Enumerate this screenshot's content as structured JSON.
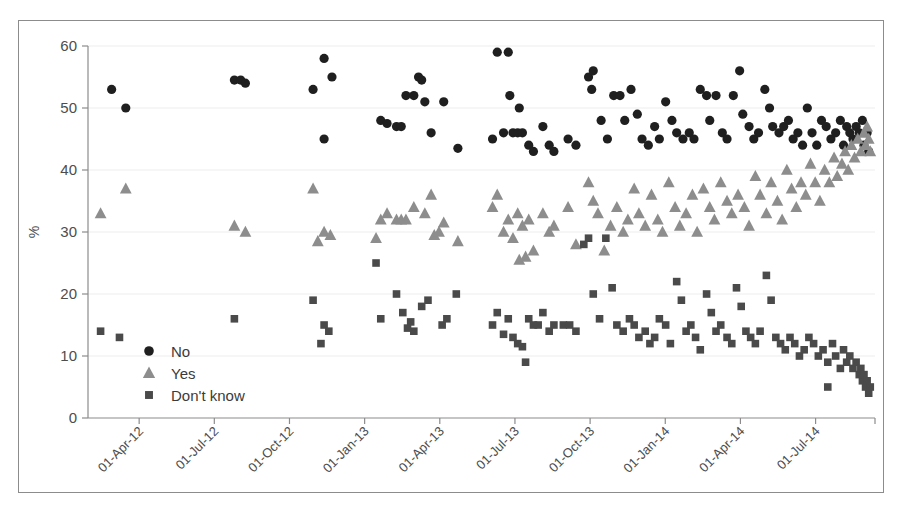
{
  "chart_data": {
    "type": "scatter",
    "title": "",
    "subtitle": "",
    "xlabel": "",
    "ylabel": "%",
    "ylim": [
      0,
      60
    ],
    "yticks": [
      0,
      10,
      20,
      30,
      40,
      50,
      60
    ],
    "xlim": [
      "2012-02-15",
      "2014-09-20"
    ],
    "xticks": [
      "01-Apr-12",
      "01-Jul-12",
      "01-Oct-12",
      "01-Jan-13",
      "01-Apr-13",
      "01-Jul-13",
      "01-Oct-13",
      "01-Jan-14",
      "01-Apr-14",
      "01-Jul-14"
    ],
    "xtick_rotation": -45,
    "grid": "horizontal",
    "legend_position": "lower-left-inside",
    "marker_colors": {
      "No": "#1f1f1f",
      "Yes": "#8d8d8d",
      "Don't know": "#4a4a4a"
    },
    "marker_shapes": {
      "No": "circle",
      "Yes": "triangle",
      "Don't know": "square"
    },
    "legend": [
      "No",
      "Yes",
      "Don't know"
    ],
    "series": [
      {
        "name": "No",
        "shape": "circle",
        "color": "#1f1f1f",
        "points": [
          [
            0.03,
            53
          ],
          [
            0.048,
            50
          ],
          [
            0.186,
            54.5
          ],
          [
            0.194,
            54.5
          ],
          [
            0.2,
            54
          ],
          [
            0.3,
            58
          ],
          [
            0.286,
            53
          ],
          [
            0.31,
            55
          ],
          [
            0.3,
            45
          ],
          [
            0.372,
            48
          ],
          [
            0.38,
            47.5
          ],
          [
            0.392,
            47
          ],
          [
            0.398,
            47
          ],
          [
            0.404,
            52
          ],
          [
            0.414,
            52
          ],
          [
            0.428,
            51
          ],
          [
            0.436,
            46
          ],
          [
            0.42,
            55
          ],
          [
            0.424,
            54.5
          ],
          [
            0.452,
            51
          ],
          [
            0.47,
            43.5
          ],
          [
            0.52,
            59
          ],
          [
            0.534,
            59
          ],
          [
            0.536,
            52
          ],
          [
            0.548,
            50
          ],
          [
            0.528,
            46
          ],
          [
            0.54,
            46
          ],
          [
            0.546,
            46
          ],
          [
            0.552,
            46
          ],
          [
            0.514,
            45
          ],
          [
            0.56,
            44
          ],
          [
            0.566,
            43
          ],
          [
            0.578,
            47
          ],
          [
            0.586,
            44
          ],
          [
            0.592,
            43
          ],
          [
            0.61,
            45
          ],
          [
            0.62,
            44
          ],
          [
            0.636,
            55
          ],
          [
            0.642,
            56
          ],
          [
            0.64,
            53
          ],
          [
            0.652,
            48
          ],
          [
            0.66,
            45
          ],
          [
            0.668,
            52
          ],
          [
            0.676,
            52
          ],
          [
            0.682,
            48
          ],
          [
            0.69,
            53
          ],
          [
            0.698,
            49
          ],
          [
            0.704,
            45
          ],
          [
            0.712,
            44
          ],
          [
            0.72,
            47
          ],
          [
            0.726,
            45
          ],
          [
            0.734,
            51
          ],
          [
            0.742,
            48
          ],
          [
            0.748,
            46
          ],
          [
            0.756,
            45
          ],
          [
            0.764,
            46
          ],
          [
            0.77,
            45
          ],
          [
            0.778,
            53
          ],
          [
            0.786,
            52
          ],
          [
            0.79,
            48
          ],
          [
            0.798,
            52
          ],
          [
            0.806,
            46
          ],
          [
            0.812,
            45
          ],
          [
            0.82,
            52
          ],
          [
            0.828,
            56
          ],
          [
            0.832,
            49
          ],
          [
            0.84,
            47
          ],
          [
            0.846,
            45
          ],
          [
            0.852,
            46
          ],
          [
            0.86,
            53
          ],
          [
            0.866,
            50
          ],
          [
            0.87,
            47
          ],
          [
            0.878,
            46
          ],
          [
            0.884,
            47
          ],
          [
            0.89,
            48
          ],
          [
            0.896,
            45
          ],
          [
            0.902,
            46
          ],
          [
            0.908,
            44
          ],
          [
            0.914,
            50
          ],
          [
            0.92,
            46
          ],
          [
            0.926,
            44
          ],
          [
            0.932,
            48
          ],
          [
            0.938,
            47
          ],
          [
            0.944,
            45
          ],
          [
            0.95,
            46
          ],
          [
            0.956,
            48
          ],
          [
            0.96,
            44
          ],
          [
            0.964,
            47
          ],
          [
            0.968,
            46
          ],
          [
            0.972,
            45
          ],
          [
            0.976,
            47
          ],
          [
            0.98,
            46
          ],
          [
            0.984,
            48
          ],
          [
            0.986,
            44
          ],
          [
            0.99,
            46
          ],
          [
            0.992,
            43
          ]
        ]
      },
      {
        "name": "Yes",
        "shape": "triangle",
        "color": "#8d8d8d",
        "points": [
          [
            0.016,
            33
          ],
          [
            0.048,
            37
          ],
          [
            0.186,
            31
          ],
          [
            0.2,
            30
          ],
          [
            0.286,
            37
          ],
          [
            0.3,
            30
          ],
          [
            0.308,
            29.5
          ],
          [
            0.292,
            28.5
          ],
          [
            0.372,
            32
          ],
          [
            0.38,
            33
          ],
          [
            0.392,
            32
          ],
          [
            0.398,
            32
          ],
          [
            0.404,
            32
          ],
          [
            0.414,
            34
          ],
          [
            0.428,
            33
          ],
          [
            0.436,
            36
          ],
          [
            0.452,
            31.5
          ],
          [
            0.47,
            28.5
          ],
          [
            0.44,
            29.5
          ],
          [
            0.446,
            30
          ],
          [
            0.366,
            29
          ],
          [
            0.52,
            36
          ],
          [
            0.534,
            32
          ],
          [
            0.546,
            33
          ],
          [
            0.528,
            30
          ],
          [
            0.54,
            29
          ],
          [
            0.552,
            31
          ],
          [
            0.514,
            34
          ],
          [
            0.56,
            32
          ],
          [
            0.566,
            27
          ],
          [
            0.578,
            33
          ],
          [
            0.586,
            30
          ],
          [
            0.592,
            31
          ],
          [
            0.61,
            34
          ],
          [
            0.62,
            28
          ],
          [
            0.548,
            25.5
          ],
          [
            0.556,
            26
          ],
          [
            0.636,
            38
          ],
          [
            0.642,
            35
          ],
          [
            0.648,
            33
          ],
          [
            0.656,
            27
          ],
          [
            0.664,
            31
          ],
          [
            0.672,
            34
          ],
          [
            0.68,
            30
          ],
          [
            0.686,
            32
          ],
          [
            0.694,
            37
          ],
          [
            0.7,
            33
          ],
          [
            0.708,
            31
          ],
          [
            0.716,
            36
          ],
          [
            0.724,
            32
          ],
          [
            0.73,
            30
          ],
          [
            0.738,
            38
          ],
          [
            0.746,
            34
          ],
          [
            0.752,
            31
          ],
          [
            0.76,
            33
          ],
          [
            0.768,
            36
          ],
          [
            0.774,
            30
          ],
          [
            0.782,
            37
          ],
          [
            0.79,
            34
          ],
          [
            0.796,
            32
          ],
          [
            0.804,
            38
          ],
          [
            0.812,
            35
          ],
          [
            0.818,
            33
          ],
          [
            0.826,
            36
          ],
          [
            0.834,
            34
          ],
          [
            0.84,
            31
          ],
          [
            0.848,
            39
          ],
          [
            0.854,
            36
          ],
          [
            0.862,
            33
          ],
          [
            0.868,
            38
          ],
          [
            0.876,
            35
          ],
          [
            0.882,
            32
          ],
          [
            0.888,
            40
          ],
          [
            0.894,
            37
          ],
          [
            0.9,
            34
          ],
          [
            0.906,
            38
          ],
          [
            0.912,
            36
          ],
          [
            0.918,
            41
          ],
          [
            0.924,
            38
          ],
          [
            0.93,
            35
          ],
          [
            0.936,
            40
          ],
          [
            0.942,
            38
          ],
          [
            0.948,
            42
          ],
          [
            0.952,
            39
          ],
          [
            0.958,
            41
          ],
          [
            0.962,
            43
          ],
          [
            0.966,
            40
          ],
          [
            0.97,
            44
          ],
          [
            0.974,
            42
          ],
          [
            0.978,
            45
          ],
          [
            0.982,
            43
          ],
          [
            0.986,
            46
          ],
          [
            0.988,
            44
          ],
          [
            0.99,
            47
          ],
          [
            0.992,
            45
          ],
          [
            0.994,
            43
          ]
        ]
      },
      {
        "name": "Don't know",
        "shape": "square",
        "color": "#4a4a4a",
        "points": [
          [
            0.016,
            14
          ],
          [
            0.04,
            13
          ],
          [
            0.186,
            16
          ],
          [
            0.286,
            19
          ],
          [
            0.3,
            15
          ],
          [
            0.306,
            14
          ],
          [
            0.296,
            12
          ],
          [
            0.366,
            25
          ],
          [
            0.372,
            16
          ],
          [
            0.392,
            20
          ],
          [
            0.4,
            17
          ],
          [
            0.41,
            15.5
          ],
          [
            0.424,
            18
          ],
          [
            0.432,
            19
          ],
          [
            0.45,
            15
          ],
          [
            0.456,
            16
          ],
          [
            0.468,
            20
          ],
          [
            0.414,
            14
          ],
          [
            0.406,
            14.5
          ],
          [
            0.52,
            17
          ],
          [
            0.534,
            16
          ],
          [
            0.54,
            13
          ],
          [
            0.528,
            13.5
          ],
          [
            0.546,
            12
          ],
          [
            0.552,
            11.5
          ],
          [
            0.514,
            15
          ],
          [
            0.56,
            16
          ],
          [
            0.566,
            15
          ],
          [
            0.556,
            9
          ],
          [
            0.572,
            15
          ],
          [
            0.578,
            17
          ],
          [
            0.586,
            14
          ],
          [
            0.592,
            15
          ],
          [
            0.604,
            15
          ],
          [
            0.612,
            15
          ],
          [
            0.62,
            14
          ],
          [
            0.63,
            28
          ],
          [
            0.636,
            29
          ],
          [
            0.642,
            20
          ],
          [
            0.65,
            16
          ],
          [
            0.658,
            29
          ],
          [
            0.666,
            21
          ],
          [
            0.672,
            15
          ],
          [
            0.68,
            14
          ],
          [
            0.688,
            16
          ],
          [
            0.694,
            15
          ],
          [
            0.7,
            13
          ],
          [
            0.708,
            14
          ],
          [
            0.714,
            12
          ],
          [
            0.72,
            13
          ],
          [
            0.726,
            16
          ],
          [
            0.734,
            15
          ],
          [
            0.74,
            12
          ],
          [
            0.748,
            22
          ],
          [
            0.754,
            19
          ],
          [
            0.76,
            14
          ],
          [
            0.766,
            15
          ],
          [
            0.772,
            13
          ],
          [
            0.778,
            11
          ],
          [
            0.786,
            20
          ],
          [
            0.792,
            17
          ],
          [
            0.798,
            14
          ],
          [
            0.804,
            15
          ],
          [
            0.812,
            13
          ],
          [
            0.818,
            12
          ],
          [
            0.824,
            21
          ],
          [
            0.83,
            18
          ],
          [
            0.836,
            14
          ],
          [
            0.842,
            13
          ],
          [
            0.848,
            12
          ],
          [
            0.854,
            14
          ],
          [
            0.862,
            23
          ],
          [
            0.868,
            19
          ],
          [
            0.874,
            13
          ],
          [
            0.88,
            12
          ],
          [
            0.886,
            11
          ],
          [
            0.892,
            13
          ],
          [
            0.898,
            12
          ],
          [
            0.904,
            10
          ],
          [
            0.91,
            11
          ],
          [
            0.916,
            13
          ],
          [
            0.922,
            12
          ],
          [
            0.928,
            10
          ],
          [
            0.934,
            11
          ],
          [
            0.94,
            9
          ],
          [
            0.946,
            12
          ],
          [
            0.95,
            10
          ],
          [
            0.956,
            8
          ],
          [
            0.96,
            11
          ],
          [
            0.964,
            9
          ],
          [
            0.968,
            10
          ],
          [
            0.972,
            8
          ],
          [
            0.976,
            9
          ],
          [
            0.98,
            7
          ],
          [
            0.982,
            8
          ],
          [
            0.984,
            6
          ],
          [
            0.986,
            7
          ],
          [
            0.988,
            5
          ],
          [
            0.99,
            6
          ],
          [
            0.992,
            4
          ],
          [
            0.994,
            5
          ],
          [
            0.94,
            5
          ]
        ]
      }
    ]
  }
}
